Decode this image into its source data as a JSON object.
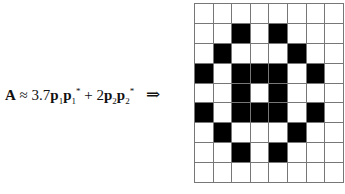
{
  "equation": {
    "lhs": "A",
    "approx": "≈",
    "coef1": "3.7",
    "coef2": "2",
    "plus": "+",
    "arrow": "⇒"
  },
  "grid": {
    "rows": 9,
    "cols": 8,
    "cells": [
      [
        0,
        0,
        0,
        0,
        0,
        0,
        0,
        0
      ],
      [
        0,
        0,
        1,
        0,
        1,
        0,
        0,
        0
      ],
      [
        0,
        1,
        0,
        0,
        0,
        1,
        0,
        0
      ],
      [
        1,
        0,
        1,
        1,
        1,
        0,
        1,
        0
      ],
      [
        0,
        0,
        1,
        0,
        1,
        0,
        0,
        0
      ],
      [
        1,
        0,
        1,
        1,
        1,
        0,
        1,
        0
      ],
      [
        0,
        1,
        0,
        0,
        0,
        1,
        0,
        0
      ],
      [
        0,
        0,
        1,
        0,
        1,
        0,
        0,
        0
      ],
      [
        0,
        0,
        0,
        0,
        0,
        0,
        0,
        0
      ]
    ],
    "on_color": "#000000",
    "off_color": "#ffffff"
  }
}
